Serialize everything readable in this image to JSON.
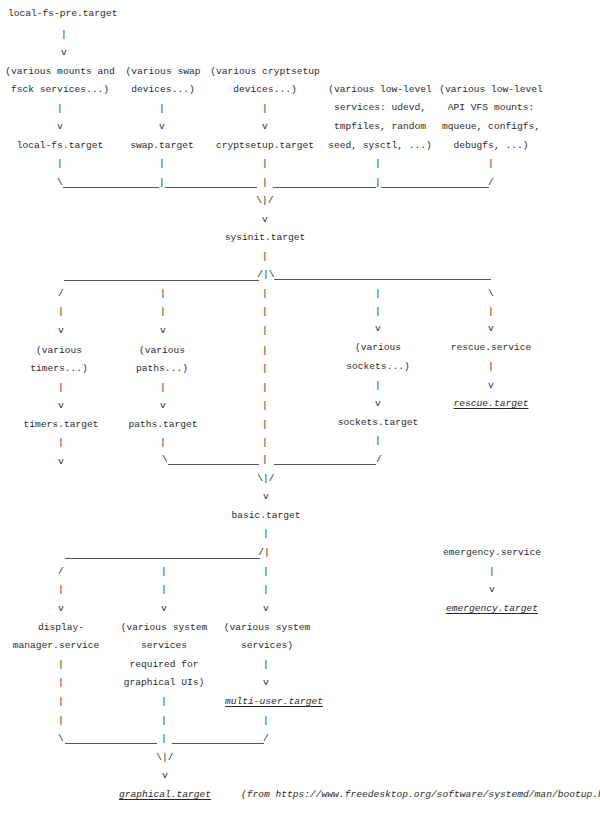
{
  "diagram": {
    "nodes": {
      "local_fs_pre": "local-fs-pre.target",
      "mounts1": "(various mounts and",
      "mounts2": "fsck services...)",
      "swapdev1": "(various swap",
      "swapdev2": "devices...)",
      "crypt1": "(various cryptsetup",
      "crypt2": "devices...)",
      "lowsvc1": "(various low-level",
      "lowsvc2": "services: udevd,",
      "lowsvc3": "tmpfiles, random",
      "lowsvc4": "seed, sysctl, ...)",
      "vfs1": "(various low-level",
      "vfs2": "API VFS mounts:",
      "vfs3": "mqueue, configfs,",
      "vfs4": "debugfs, ...)",
      "local_fs": "local-fs.target",
      "swap": "swap.target",
      "cryptsetup": "cryptsetup.target",
      "sysinit": "sysinit.target",
      "timers1": "(various",
      "timers2": "timers...)",
      "paths1": "(various",
      "paths2": "paths...)",
      "sockets1": "(various",
      "sockets2": "sockets...)",
      "rescue_service": "rescue.service",
      "rescue_target": "rescue.target",
      "timers": "timers.target",
      "paths": "paths.target",
      "sockets": "sockets.target",
      "basic": "basic.target",
      "emergency_service": "emergency.service",
      "emergency_target": "emergency.target",
      "dm1": "display-",
      "dm2": "manager.service",
      "gsvc1": "(various system",
      "gsvc2": "services",
      "gsvc3": "required for",
      "gsvc4": "graphical UIs)",
      "ssvc1": "(various system",
      "ssvc2": "services)",
      "multi_user": "multi-user.target",
      "graphical": "graphical.target"
    },
    "glyphs": {
      "pipe": "|",
      "arrow": "v",
      "bslash": "\\",
      "slash": "/",
      "merge": "\\|/",
      "split_l": "/|",
      "split_lr": "/|\\"
    },
    "source_note": "(from https://www.freedesktop.org/software/systemd/man/bootup.html)"
  }
}
